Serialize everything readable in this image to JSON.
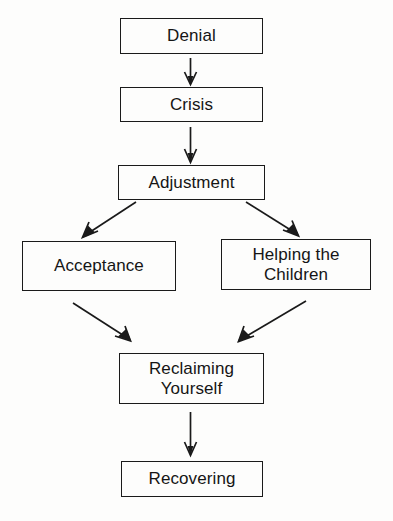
{
  "diagram": {
    "background_color": "#fdfdfc",
    "line_color": "#1a1a1a",
    "text_color": "#151515",
    "nodes": [
      {
        "id": "denial",
        "label": "Denial"
      },
      {
        "id": "crisis",
        "label": "Crisis"
      },
      {
        "id": "adjustment",
        "label": "Adjustment"
      },
      {
        "id": "acceptance",
        "label": "Acceptance"
      },
      {
        "id": "helping",
        "label": "Helping the\nChildren"
      },
      {
        "id": "reclaiming",
        "label": "Reclaiming\nYourself"
      },
      {
        "id": "recovering",
        "label": "Recovering"
      }
    ],
    "edges": [
      {
        "from": "denial",
        "to": "crisis",
        "style": "vertical-arrow"
      },
      {
        "from": "crisis",
        "to": "adjustment",
        "style": "vertical-arrow"
      },
      {
        "from": "adjustment",
        "to": "acceptance",
        "style": "diagonal-arrow-left"
      },
      {
        "from": "adjustment",
        "to": "helping",
        "style": "diagonal-arrow-right"
      },
      {
        "from": "acceptance",
        "to": "reclaiming",
        "style": "diagonal-arrow-right"
      },
      {
        "from": "helping",
        "to": "reclaiming",
        "style": "diagonal-arrow-left"
      },
      {
        "from": "reclaiming",
        "to": "recovering",
        "style": "vertical-arrow"
      }
    ]
  }
}
